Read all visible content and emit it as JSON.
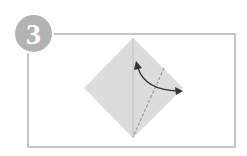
{
  "step": {
    "number": "3"
  },
  "diagram": {
    "colors": {
      "paper": "#dcdcdc",
      "crease": "#b9b9b9",
      "dashed_line": "#9a9a9a",
      "arrow": "#333333",
      "frame": "#c4c4c4",
      "badge": "#b3b3b3"
    },
    "icons": [
      "fold-arrow-icon",
      "valley-fold-line"
    ]
  }
}
